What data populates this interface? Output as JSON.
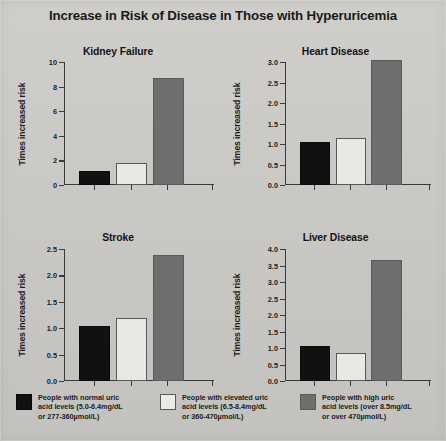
{
  "title": "Increase in Risk of Disease in Those with Hyperuricemia",
  "axis_label": "Times increased risk",
  "colors": {
    "normal": "#111111",
    "elevated": "#eceae6",
    "high": "#6e6e6e",
    "background": "#c9c9c7",
    "axis": "#3a3a3a"
  },
  "legend": {
    "items": [
      {
        "key": "normal",
        "swatch": "black-filled-square",
        "line1": "People with normal uric",
        "line2": "acid levels (5.0-6.4mg/dL",
        "line3": "or 277-360µmol/L)"
      },
      {
        "key": "elevated",
        "swatch": "white-open-square",
        "line1": "People with elevated uric",
        "line2": "acid levels (6.5-8.4mg/dL",
        "line3": "or 360-470µmol/L)"
      },
      {
        "key": "high",
        "swatch": "gray-filled-square",
        "line1": "People with high uric",
        "line2": "acid levels (over 8.5mg/dL",
        "line3": "or over 470µmol/L)"
      }
    ]
  },
  "chart_data": [
    {
      "type": "bar",
      "title": "Kidney Failure",
      "xlabel": "",
      "ylabel": "Times increased risk",
      "categories": [
        "People with normal uric acid levels",
        "People with elevated uric acid levels",
        "People with high uric acid levels"
      ],
      "values": [
        1.0,
        1.6,
        8.5
      ],
      "ylim": [
        0,
        10
      ],
      "yticks": [
        0,
        2,
        4,
        6,
        8,
        10
      ],
      "ytick_labels": [
        "0",
        "2",
        "4",
        "6",
        "8",
        "10"
      ],
      "grid": false,
      "legend_position": "bottom"
    },
    {
      "type": "bar",
      "title": "Heart Disease",
      "xlabel": "",
      "ylabel": "Times increased risk",
      "categories": [
        "People with normal uric acid levels",
        "People with elevated uric acid levels",
        "People with high uric acid levels"
      ],
      "values": [
        1.0,
        1.1,
        3.0
      ],
      "ylim": [
        0,
        3.0
      ],
      "yticks": [
        0.0,
        0.5,
        1.0,
        1.5,
        2.0,
        2.5,
        3.0
      ],
      "ytick_labels": [
        "0.0",
        "0.5",
        "1.0",
        "1.5",
        "2.0",
        "2.5",
        "3.0"
      ],
      "grid": false,
      "legend_position": "bottom"
    },
    {
      "type": "bar",
      "title": "Stroke",
      "xlabel": "",
      "ylabel": "Times increased risk",
      "categories": [
        "People with normal uric acid levels",
        "People with elevated uric acid levels",
        "People with high uric acid levels"
      ],
      "values": [
        1.0,
        1.15,
        2.35
      ],
      "ylim": [
        0,
        2.5
      ],
      "yticks": [
        0.0,
        0.5,
        1.0,
        1.5,
        2.0,
        2.5
      ],
      "ytick_labels": [
        "0.0",
        "0.5",
        "1.0",
        "1.5",
        "2.0",
        "2.5"
      ],
      "grid": false,
      "legend_position": "bottom"
    },
    {
      "type": "bar",
      "title": "Liver Disease",
      "xlabel": "",
      "ylabel": "Times increased risk",
      "categories": [
        "People with normal uric acid levels",
        "People with elevated uric acid levels",
        "People with high uric acid levels"
      ],
      "values": [
        1.0,
        0.78,
        3.6
      ],
      "ylim": [
        0,
        4.0
      ],
      "yticks": [
        0.0,
        0.5,
        1.0,
        1.5,
        2.0,
        2.5,
        3.0,
        3.5,
        4.0
      ],
      "ytick_labels": [
        "0.0",
        "0.5",
        "1.0",
        "1.5",
        "2.0",
        "2.5",
        "3.0",
        "3.5",
        "4.0"
      ],
      "grid": false,
      "legend_position": "bottom"
    }
  ]
}
